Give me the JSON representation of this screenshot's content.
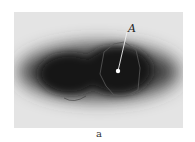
{
  "figure": {
    "subfigure_label": "a",
    "point_label": "A",
    "colors": {
      "background": "#e4e4e4",
      "blob": "#1a1a1a",
      "contour": "#555555",
      "marker": "#ffffff"
    }
  }
}
